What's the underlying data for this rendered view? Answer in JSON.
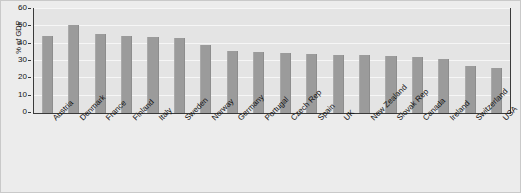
{
  "chart_data": {
    "type": "bar",
    "title": "",
    "xlabel": "",
    "ylabel": "% of GDP",
    "ylim": [
      0,
      60
    ],
    "ytick_labels": [
      "0",
      "10",
      "20",
      "30",
      "40",
      "50",
      "60"
    ],
    "yticks": [
      0,
      10,
      20,
      30,
      40,
      50,
      60
    ],
    "grid": true,
    "legend": "none",
    "bar_color": "#9b9b9b",
    "plot_background": "#e4e4e4",
    "figure_background": "#ececec",
    "gridline_color": "#f6f6f6",
    "axis_color": "#3a3a3a",
    "categories": [
      "Austria",
      "Denmark",
      "France",
      "Finland",
      "Italy",
      "Sweden",
      "Norway",
      "Germany",
      "Portugal",
      "Czech Rep",
      "Spain",
      "UK",
      "New Zealand",
      "Slovak Rep",
      "Canada",
      "Ireland",
      "Switzerland",
      "USA"
    ],
    "values": [
      44.5,
      50.5,
      45.5,
      44.5,
      44.0,
      43.5,
      39.5,
      36.0,
      35.0,
      34.5,
      34.0,
      33.5,
      33.5,
      33.0,
      32.5,
      31.0,
      27.0,
      26.0
    ]
  }
}
